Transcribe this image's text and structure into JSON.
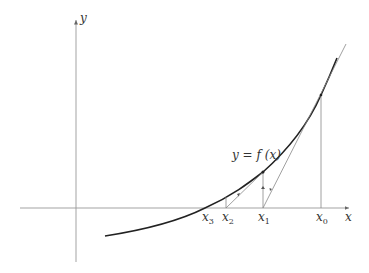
{
  "diagram": {
    "axes": {
      "x_label": "x",
      "y_label": "y"
    },
    "curve_label": "y = f (x)",
    "points": [
      {
        "name": "x0",
        "base": "x",
        "sub": "0"
      },
      {
        "name": "x1",
        "base": "x",
        "sub": "1"
      },
      {
        "name": "x2",
        "base": "x",
        "sub": "2"
      },
      {
        "name": "x3",
        "base": "x",
        "sub": "3"
      }
    ],
    "colors": {
      "curve": "#222222",
      "axis": "#999999",
      "guide": "#888888",
      "text": "#333333"
    }
  }
}
